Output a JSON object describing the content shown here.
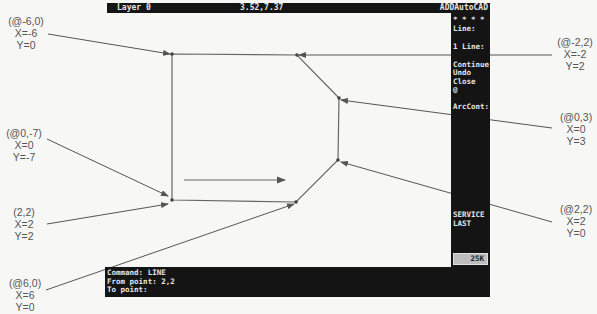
{
  "status_bar": {
    "layer": "Layer 0",
    "coordinates": "3.52,7.37",
    "app_title": "ADDAutoCAD"
  },
  "side_menu": {
    "items": [
      {
        "label": "* * * *"
      },
      {
        "label": "Line:"
      },
      {
        "label": "1 Line:"
      },
      {
        "label": "Continue"
      },
      {
        "label": "Undo"
      },
      {
        "label": "Close"
      },
      {
        "label": "@"
      },
      {
        "label": "ArcCont:"
      },
      {
        "label": "SERVICE"
      },
      {
        "label": "LAST"
      }
    ],
    "memory": "25K"
  },
  "command_area": {
    "lines": [
      "Command: LINE",
      "From point: 2,2",
      "To point:"
    ]
  },
  "drawing": {
    "vertices": [
      {
        "name": "top-left",
        "x": 172,
        "y": 54
      },
      {
        "name": "top-right",
        "x": 297,
        "y": 55
      },
      {
        "name": "right-upper",
        "x": 339,
        "y": 98
      },
      {
        "name": "right-lower",
        "x": 338,
        "y": 160
      },
      {
        "name": "bottom-right",
        "x": 296,
        "y": 202
      },
      {
        "name": "bottom-left",
        "x": 172,
        "y": 200
      }
    ],
    "line_color": "#666666"
  },
  "annotations": [
    {
      "title": "(@-6,0)",
      "x": "X=-6",
      "y": "Y=0"
    },
    {
      "title": "(@0,-7)",
      "x": "X=0",
      "y": "Y=-7"
    },
    {
      "title": "(2,2)",
      "x": "X=2",
      "y": "Y=2"
    },
    {
      "title": "(@6,0)",
      "x": "X=6",
      "y": "Y=0"
    },
    {
      "title": "(@-2,2)",
      "x": "X=-2",
      "y": "Y=2"
    },
    {
      "title": "(@0,3)",
      "x": "X=0",
      "y": "Y=3"
    },
    {
      "title": "(@2,2)",
      "x": "X=2",
      "y": "Y=0"
    }
  ]
}
